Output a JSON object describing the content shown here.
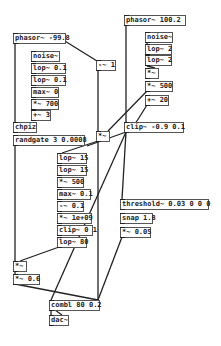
{
  "patch": {
    "objects": [
      {
        "id": "phasor-left",
        "text": "phasor~ -99.8",
        "x": 13,
        "y": 33,
        "w": 53
      },
      {
        "id": "phasor-right",
        "text": "phasor~ 100.2",
        "x": 124,
        "y": 15,
        "w": 62
      },
      {
        "id": "noise-left",
        "text": "noise~",
        "x": 31,
        "y": 51,
        "w": 29
      },
      {
        "id": "lop-0.1-a",
        "text": "lop~ 0.1",
        "x": 31,
        "y": 63,
        "w": 35
      },
      {
        "id": "lop-0.1-b",
        "text": "lop~ 0.1",
        "x": 31,
        "y": 75,
        "w": 35
      },
      {
        "id": "max-0",
        "text": "max~ 0",
        "x": 31,
        "y": 87,
        "w": 28
      },
      {
        "id": "mul-700",
        "text": "*~ 700",
        "x": 31,
        "y": 99,
        "w": 28
      },
      {
        "id": "add-3",
        "text": "+~ 3",
        "x": 31,
        "y": 110,
        "w": 20
      },
      {
        "id": "chpiz",
        "text": "chpiz",
        "x": 13,
        "y": 122,
        "w": 24
      },
      {
        "id": "randgate",
        "text": "randgate 3 0.0008",
        "x": 13,
        "y": 135,
        "w": 72
      },
      {
        "id": "sub-1",
        "text": "-~ 1",
        "x": 96,
        "y": 60,
        "w": 20
      },
      {
        "id": "noise-right",
        "text": "noise~",
        "x": 145,
        "y": 32,
        "w": 28
      },
      {
        "id": "lop-2-a",
        "text": "lop~ 2",
        "x": 145,
        "y": 44,
        "w": 27
      },
      {
        "id": "lop-2-b",
        "text": "lop~ 2",
        "x": 145,
        "y": 55,
        "w": 27
      },
      {
        "id": "mul-right",
        "text": "*~",
        "x": 145,
        "y": 68,
        "w": 14
      },
      {
        "id": "mul-500-right",
        "text": "*~ 500",
        "x": 145,
        "y": 81,
        "w": 28
      },
      {
        "id": "add-20",
        "text": "+~ 20",
        "x": 145,
        "y": 95,
        "w": 24
      },
      {
        "id": "mul-mid",
        "text": "*~",
        "x": 96,
        "y": 131,
        "w": 14
      },
      {
        "id": "clip-top",
        "text": "clip~ -0.9 0.1",
        "x": 124,
        "y": 122,
        "w": 60
      },
      {
        "id": "lop-15-a",
        "text": "lop~ 15",
        "x": 57,
        "y": 153,
        "w": 30
      },
      {
        "id": "lop-15-b",
        "text": "lop~ 15",
        "x": 57,
        "y": 165,
        "w": 30
      },
      {
        "id": "mul-500-left",
        "text": "*~ 500",
        "x": 57,
        "y": 177,
        "w": 27
      },
      {
        "id": "max-0.1",
        "text": "max~ 0.1",
        "x": 57,
        "y": 189,
        "w": 34
      },
      {
        "id": "sub-0.1",
        "text": "-~ 0.1",
        "x": 57,
        "y": 201,
        "w": 27
      },
      {
        "id": "mul-1e09",
        "text": "*~ 1e+09",
        "x": 57,
        "y": 213,
        "w": 35
      },
      {
        "id": "clip-bottom",
        "text": "clip~ 0 1",
        "x": 57,
        "y": 225,
        "w": 36
      },
      {
        "id": "lop-80",
        "text": "lop~ 80",
        "x": 57,
        "y": 237,
        "w": 30
      },
      {
        "id": "threshold",
        "text": "threshold~ 0.03 0 0 0",
        "x": 120,
        "y": 199,
        "w": 89
      },
      {
        "id": "snap",
        "text": "snap 1.8",
        "x": 120,
        "y": 213,
        "w": 33
      },
      {
        "id": "mul-0.05",
        "text": "*~ 0.05",
        "x": 120,
        "y": 227,
        "w": 31
      },
      {
        "id": "mul-low",
        "text": "*~",
        "x": 13,
        "y": 261,
        "w": 14
      },
      {
        "id": "mul-0.6",
        "text": "*~ 0.6",
        "x": 13,
        "y": 274,
        "w": 27
      },
      {
        "id": "comb",
        "text": "combl 80 0.2",
        "x": 49,
        "y": 300,
        "w": 51
      },
      {
        "id": "dac",
        "text": "dac~",
        "x": 49,
        "y": 315,
        "w": 20
      }
    ]
  }
}
